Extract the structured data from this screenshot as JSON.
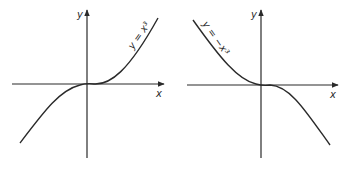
{
  "graphs": [
    {
      "name": "cubic",
      "x_axis_label": "x",
      "y_axis_label": "y",
      "curve_label": "y = x³",
      "equation": "y = x^3"
    },
    {
      "name": "negative-cubic",
      "x_axis_label": "x",
      "y_axis_label": "y",
      "curve_label": "y = −x³",
      "equation": "y = -x^3"
    }
  ],
  "colors": {
    "ink": "#2a2a2a",
    "background": "#ffffff"
  }
}
